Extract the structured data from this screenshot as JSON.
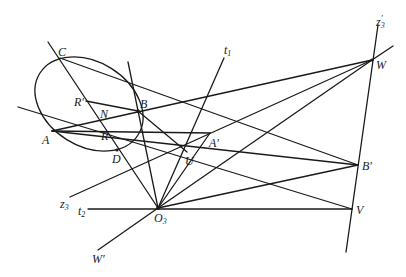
{
  "figure": {
    "type": "projective geometry construction"
  },
  "points": {
    "A": {
      "label": "A",
      "x": 52,
      "y": 131
    },
    "B": {
      "label": "B",
      "x": 138,
      "y": 111
    },
    "C": {
      "label": "C",
      "x": 60,
      "y": 58
    },
    "D": {
      "label": "D",
      "x": 117,
      "y": 150
    },
    "N": {
      "label": "N",
      "x": 101,
      "y": 118
    },
    "R": {
      "label": "R",
      "x": 103,
      "y": 135
    },
    "Rp": {
      "label": "R′",
      "x": 86,
      "y": 101
    },
    "U": {
      "label": "U",
      "x": 187,
      "y": 152
    },
    "Ap": {
      "label": "A′",
      "x": 210,
      "y": 133
    },
    "O3": {
      "label": "O",
      "sub": "3",
      "x": 158,
      "y": 208
    },
    "W": {
      "label": "W",
      "x": 372,
      "y": 60
    },
    "Bp": {
      "label": "B′",
      "x": 358,
      "y": 165
    },
    "V": {
      "label": "V",
      "x": 352,
      "y": 209
    }
  },
  "line_labels": {
    "t1": {
      "label": "t",
      "sub": "1"
    },
    "t2": {
      "label": "t",
      "sub": "2"
    },
    "z3": {
      "label": "z",
      "sub": "3"
    },
    "z3p": {
      "label": "z",
      "sub": "3",
      "sup": "′"
    },
    "Wp": {
      "label": "W′"
    }
  }
}
